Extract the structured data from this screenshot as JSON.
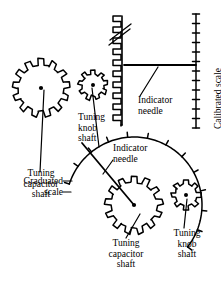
{
  "figure": {
    "ink_color": "#000000",
    "background_color": "#ffffff"
  },
  "labels": {
    "upper_tuning_capacitor_shaft": "Tuning\ncapacitor\nshaft",
    "upper_tuning_knob_shaft": "Tuning\nknob\nshaft",
    "upper_indicator_needle": "Indicator\nneedle",
    "calibrated_scale": "Calibrated scale",
    "graduated_scale": "Graduated\nscale",
    "lower_indicator_needle": "Indicator\nneedle",
    "lower_tuning_capacitor_shaft": "Tuning\ncapacitor\nshaft",
    "lower_tuning_knob_shaft": "Tuning\nknob\nshaft"
  },
  "parts": {
    "upper_large_gear": {
      "name": "tuning-capacitor-gear-upper",
      "cx": 41,
      "cy": 88,
      "outer_r": 29,
      "root_r": 23,
      "teeth": 13,
      "hub_r": 2.1
    },
    "upper_small_gear": {
      "name": "tuning-knob-gear-upper",
      "cx": 93,
      "cy": 85,
      "outer_r": 15,
      "root_r": 11,
      "teeth": 9,
      "hub_r": 2.0
    },
    "lower_large_gear": {
      "name": "tuning-capacitor-gear-lower",
      "cx": 134,
      "cy": 205,
      "outer_r": 29,
      "root_r": 23,
      "teeth": 13,
      "hub_r": 2.1
    },
    "lower_small_gear": {
      "name": "tuning-knob-gear-lower",
      "cx": 186,
      "cy": 195,
      "outer_r": 15,
      "root_r": 11,
      "teeth": 8,
      "hub_r": 2.0
    },
    "rack": {
      "name": "vertical-rack",
      "x": 122,
      "y_top": 16,
      "y_bottom": 125,
      "tooth_depth": 9,
      "tooth_pitch": 11,
      "break_symbol": true
    },
    "calibrated_scale": {
      "name": "calibrated-scale-linear",
      "x": 196,
      "y_top": 14,
      "y_bottom": 128,
      "tick_count": 13,
      "tick_len": 7
    },
    "upper_needle": {
      "name": "indicator-needle-upper",
      "x1": 124,
      "y1": 65,
      "x2": 196,
      "y2": 65
    },
    "graduated_scale_arc": {
      "name": "graduated-scale-arc",
      "cx": 134,
      "cy": 205,
      "radius": 68,
      "start_angle_deg": -72,
      "end_angle_deg": 128,
      "tick_count": 13,
      "tick_len": 5
    },
    "lower_needle": {
      "name": "indicator-needle-lower",
      "x1": 134,
      "y1": 205,
      "x2": 82,
      "y2": 143
    }
  },
  "leaders": {
    "upper_capacitor": {
      "x1": 40,
      "y1": 172,
      "x2": 44,
      "y2": 90
    },
    "upper_knob": {
      "x1": 99,
      "y1": 147,
      "x2": 92,
      "y2": 88
    },
    "upper_needle_leader": {
      "x1": 140,
      "y1": 96,
      "x2": 158,
      "y2": 67
    },
    "graduated_leader_a": {
      "x1": 63,
      "y1": 181,
      "x2": 72,
      "y2": 181
    },
    "graduated_leader_b": {
      "x1": 63,
      "y1": 192,
      "x2": 71,
      "y2": 192
    },
    "lower_needle_leader": {
      "x1": 113,
      "y1": 160,
      "x2": 103,
      "y2": 174
    },
    "lower_capacitor": {
      "x1": 126,
      "y1": 238,
      "x2": 140,
      "y2": 214
    },
    "lower_knob": {
      "x1": 184,
      "y1": 228,
      "x2": 187,
      "y2": 199
    }
  }
}
